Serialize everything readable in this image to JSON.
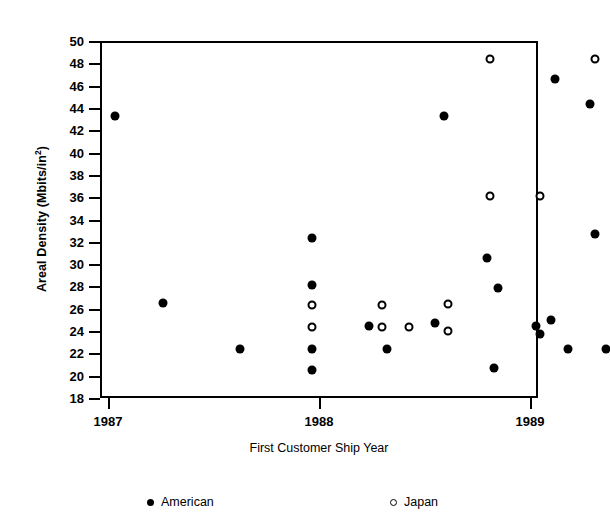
{
  "chart_data": {
    "type": "scatter",
    "title": "",
    "xlabel": "First Customer Ship Year",
    "ylabel": "Areal Density (Mbits/in2)",
    "ylabel_main": "Areal Density (Mbits/in",
    "ylabel_sup": "2",
    "ylabel_tail": ")",
    "xlim": [
      1987,
      1989
    ],
    "ylim": [
      18,
      50
    ],
    "grid": false,
    "legend_position": "bottom",
    "xticks": [
      1987,
      1988,
      1989
    ],
    "xtick_labels": [
      "1987",
      "1988",
      "1989"
    ],
    "yticks": [
      18,
      20,
      22,
      24,
      26,
      28,
      30,
      32,
      34,
      36,
      38,
      40,
      42,
      44,
      46,
      48,
      50
    ],
    "ytick_labels": [
      "18",
      "20",
      "22",
      "24",
      "26",
      "28",
      "30",
      "32",
      "34",
      "36",
      "38",
      "40",
      "42",
      "44",
      "46",
      "48",
      "50"
    ],
    "series": [
      {
        "name": "American",
        "marker": "filled-circle",
        "color": "#000000",
        "points": [
          {
            "x": 1987.06,
            "y": 43.5
          },
          {
            "x": 1987.28,
            "y": 26.7
          },
          {
            "x": 1987.63,
            "y": 22.6
          },
          {
            "x": 1987.96,
            "y": 32.5
          },
          {
            "x": 1987.96,
            "y": 28.3
          },
          {
            "x": 1987.96,
            "y": 22.6
          },
          {
            "x": 1987.96,
            "y": 20.7
          },
          {
            "x": 1988.22,
            "y": 24.6
          },
          {
            "x": 1988.3,
            "y": 22.6
          },
          {
            "x": 1988.52,
            "y": 24.9
          },
          {
            "x": 1988.56,
            "y": 43.5
          },
          {
            "x": 1988.76,
            "y": 30.7
          },
          {
            "x": 1988.79,
            "y": 20.9
          },
          {
            "x": 1988.81,
            "y": 28.0
          },
          {
            "x": 1988.98,
            "y": 24.6
          },
          {
            "x": 1989.0,
            "y": 23.9
          },
          {
            "x": 1989.05,
            "y": 25.2
          },
          {
            "x": 1989.07,
            "y": 46.8
          },
          {
            "x": 1989.13,
            "y": 22.6
          },
          {
            "x": 1989.23,
            "y": 44.5
          },
          {
            "x": 1989.25,
            "y": 32.9
          },
          {
            "x": 1989.3,
            "y": 22.6
          }
        ]
      },
      {
        "name": "Japan",
        "marker": "open-circle",
        "color": "#000000",
        "points": [
          {
            "x": 1987.96,
            "y": 26.5
          },
          {
            "x": 1987.96,
            "y": 24.5
          },
          {
            "x": 1988.28,
            "y": 26.5
          },
          {
            "x": 1988.28,
            "y": 24.5
          },
          {
            "x": 1988.4,
            "y": 24.5
          },
          {
            "x": 1988.58,
            "y": 26.6
          },
          {
            "x": 1988.58,
            "y": 24.2
          },
          {
            "x": 1988.77,
            "y": 48.6
          },
          {
            "x": 1988.77,
            "y": 36.3
          },
          {
            "x": 1989.0,
            "y": 36.3
          },
          {
            "x": 1989.25,
            "y": 48.6
          }
        ]
      }
    ]
  },
  "legend": {
    "items": [
      {
        "label": "American",
        "marker": "filled-circle"
      },
      {
        "label": "Japan",
        "marker": "open-circle"
      }
    ]
  }
}
